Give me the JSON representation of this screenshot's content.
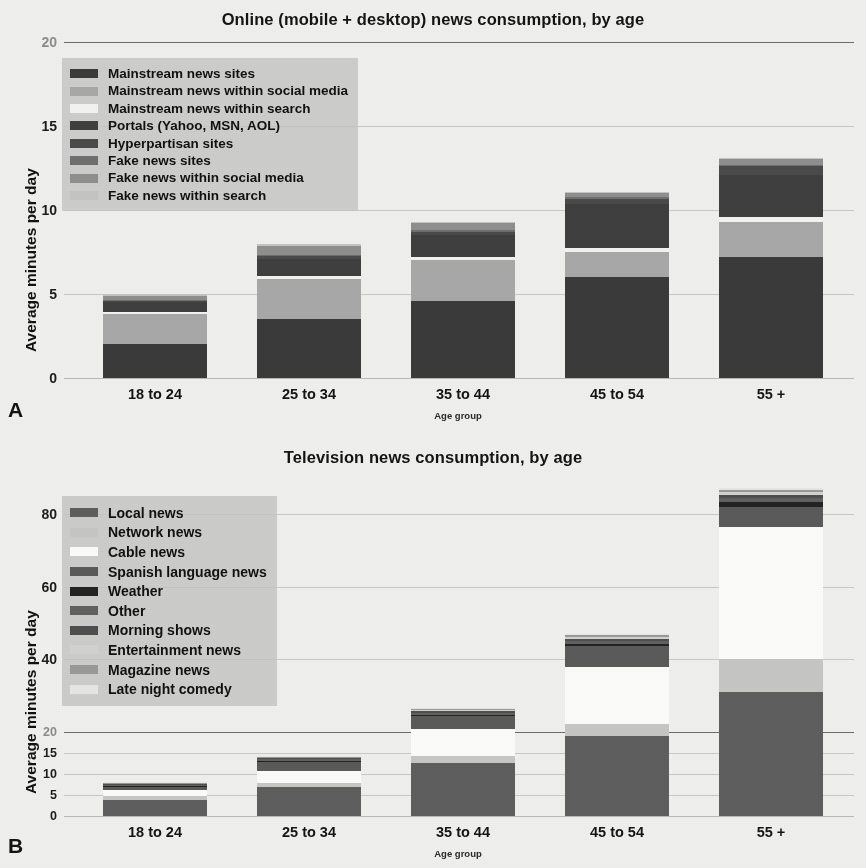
{
  "figure": {
    "background": "#efefee",
    "axis_title": "Average minutes per day",
    "x_axis_title": "Age group",
    "categories": [
      "18 to 24",
      "25 to 34",
      "35 to 44",
      "45 to 54",
      "55 +"
    ]
  },
  "panelA": {
    "letter": "A",
    "title_prefix": "Online (mobile + desktop)",
    "title": "Online (mobile + desktop) news consumption, by age",
    "ylabel": "Average minutes per day",
    "xlabel": "Age group",
    "yticks": [
      "0",
      "5",
      "10",
      "15",
      "20"
    ],
    "legend": [
      {
        "label": "Mainstream news sites",
        "color": "#3a3a3a"
      },
      {
        "label": "Mainstream news within social media",
        "color": "#a8a8a8"
      },
      {
        "label": "Mainstream news within search",
        "color": "#f2f2f0"
      },
      {
        "label": "Portals (Yahoo, MSN, AOL)",
        "color": "#3f3f3f"
      },
      {
        "label": "Hyperpartisan sites",
        "color": "#4a4a4a"
      },
      {
        "label": "Fake news sites",
        "color": "#6f6f6f"
      },
      {
        "label": "Fake news within social media",
        "color": "#8f8f8f"
      },
      {
        "label": "Fake news within search",
        "color": "#c4c4c2"
      }
    ]
  },
  "panelB": {
    "letter": "B",
    "title_prefix": "Television",
    "title": "Television news consumption, by age",
    "ylabel": "Average minutes per day",
    "xlabel": "Age group",
    "yticks_lower": [
      "0",
      "5",
      "10",
      "15",
      "20"
    ],
    "yticks_upper": [
      "20",
      "40",
      "60",
      "80"
    ],
    "legend": [
      {
        "label": "Local news",
        "color": "#5e5e5e"
      },
      {
        "label": "Network news",
        "color": "#c6c6c4"
      },
      {
        "label": "Cable news",
        "color": "#fbfbf9"
      },
      {
        "label": "Spanish language news",
        "color": "#5a5a5a"
      },
      {
        "label": "Weather",
        "color": "#232323"
      },
      {
        "label": "Other",
        "color": "#616161"
      },
      {
        "label": "Morning shows",
        "color": "#4e4e4e"
      },
      {
        "label": "Entertainment news",
        "color": "#d2d2d0"
      },
      {
        "label": "Magazine news",
        "color": "#9a9a98"
      },
      {
        "label": "Late night comedy",
        "color": "#e6e6e4"
      }
    ]
  },
  "chart_data": [
    {
      "type": "bar",
      "stacked": true,
      "panel": "A",
      "title": "Online (mobile + desktop) news consumption, by age",
      "xlabel": "Age group",
      "ylabel": "Average minutes per day",
      "ylim": [
        0,
        20
      ],
      "yticks": [
        0,
        5,
        10,
        15,
        20
      ],
      "grid": true,
      "legend_position": "upper-left (inside plot)",
      "categories": [
        "18 to 24",
        "25 to 34",
        "35 to 44",
        "45 to 54",
        "55 +"
      ],
      "series": [
        {
          "name": "Mainstream news sites",
          "color": "#3a3a3a",
          "values": [
            2.0,
            3.5,
            4.6,
            6.0,
            7.2
          ]
        },
        {
          "name": "Mainstream news within social media",
          "color": "#a8a8a8",
          "values": [
            1.8,
            2.4,
            2.4,
            1.5,
            2.1
          ]
        },
        {
          "name": "Mainstream news within search",
          "color": "#f2f2f0",
          "values": [
            0.15,
            0.2,
            0.2,
            0.25,
            0.3
          ]
        },
        {
          "name": "Portals (Yahoo, MSN, AOL)",
          "color": "#3f3f3f",
          "values": [
            0.55,
            1.0,
            1.3,
            2.6,
            2.5
          ]
        },
        {
          "name": "Hyperpartisan sites",
          "color": "#4a4a4a",
          "values": [
            0.1,
            0.15,
            0.2,
            0.3,
            0.5
          ]
        },
        {
          "name": "Fake news sites",
          "color": "#6f6f6f",
          "values": [
            0.05,
            0.08,
            0.1,
            0.1,
            0.1
          ]
        },
        {
          "name": "Fake news within social media",
          "color": "#8f8f8f",
          "values": [
            0.25,
            0.5,
            0.4,
            0.25,
            0.35
          ]
        },
        {
          "name": "Fake news within search",
          "color": "#c4c4c2",
          "values": [
            0.1,
            0.12,
            0.1,
            0.05,
            0.05
          ]
        }
      ],
      "totals": [
        5.0,
        7.95,
        9.3,
        11.05,
        13.1
      ]
    },
    {
      "type": "bar",
      "stacked": true,
      "panel": "B",
      "title": "Television news consumption, by age",
      "xlabel": "Age group",
      "ylabel": "Average minutes per day",
      "broken_axis": true,
      "axis_lower_range": [
        0,
        20
      ],
      "axis_upper_range": [
        20,
        90
      ],
      "yticks_lower": [
        0,
        5,
        10,
        15,
        20
      ],
      "yticks_upper": [
        20,
        40,
        60,
        80
      ],
      "grid": true,
      "legend_position": "upper-left (inside plot)",
      "categories": [
        "18 to 24",
        "25 to 34",
        "35 to 44",
        "45 to 54",
        "55 +"
      ],
      "series": [
        {
          "name": "Local news",
          "color": "#5e5e5e",
          "values": [
            3.9,
            6.9,
            12.6,
            19.0,
            31.0
          ]
        },
        {
          "name": "Network news",
          "color": "#c6c6c4",
          "values": [
            0.8,
            1.0,
            1.6,
            3.3,
            9.0
          ]
        },
        {
          "name": "Cable news",
          "color": "#fbfbf9",
          "values": [
            1.4,
            2.8,
            6.5,
            15.5,
            36.5
          ]
        },
        {
          "name": "Spanish language news",
          "color": "#5a5a5a",
          "values": [
            0.9,
            2.1,
            3.6,
            5.8,
            5.5
          ]
        },
        {
          "name": "Weather",
          "color": "#232323",
          "values": [
            0.3,
            0.4,
            0.5,
            0.7,
            1.3
          ]
        },
        {
          "name": "Other",
          "color": "#616161",
          "values": [
            0.2,
            0.3,
            0.5,
            0.8,
            1.1
          ]
        },
        {
          "name": "Morning shows",
          "color": "#4e4e4e",
          "values": [
            0.2,
            0.3,
            0.4,
            0.6,
            0.9
          ]
        },
        {
          "name": "Entertainment news",
          "color": "#d2d2d0",
          "values": [
            0.15,
            0.2,
            0.3,
            0.5,
            0.8
          ]
        },
        {
          "name": "Magazine news",
          "color": "#9a9a98",
          "values": [
            0.1,
            0.15,
            0.3,
            0.5,
            0.7
          ]
        },
        {
          "name": "Late night comedy",
          "color": "#e6e6e4",
          "values": [
            0.15,
            0.15,
            0.2,
            0.3,
            0.4
          ]
        }
      ],
      "totals": [
        8.1,
        14.3,
        26.5,
        47.0,
        87.2
      ]
    }
  ]
}
